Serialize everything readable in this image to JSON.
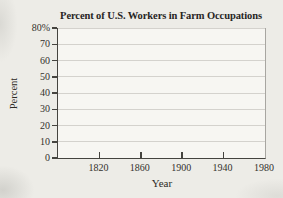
{
  "page": {
    "background": "#edece7",
    "paper_color": "#f7f6f2"
  },
  "chart_data": {
    "type": "line",
    "title": "Percent of U.S. Workers in Farm Occupations",
    "xlabel": "Year",
    "ylabel": "Percent",
    "xlim": [
      1780,
      1980
    ],
    "ylim": [
      0,
      80
    ],
    "x_ticks": [
      1820,
      1860,
      1900,
      1940,
      1980
    ],
    "x_tick_labels": [
      "1820",
      "1860",
      "1900",
      "1940",
      "1980"
    ],
    "y_ticks": [
      0,
      10,
      20,
      30,
      40,
      50,
      60,
      70,
      80
    ],
    "y_tick_labels": [
      "0",
      "10",
      "20",
      "30",
      "40",
      "50",
      "60",
      "70",
      "80%"
    ],
    "grid": true,
    "series": [],
    "axis_color": "#45443f",
    "grid_color": "#d4d2cd",
    "right_border_color": "#a8a6a1"
  }
}
